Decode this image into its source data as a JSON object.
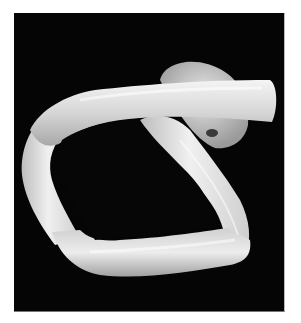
{
  "image": {
    "subject": "twisted-loop-object",
    "description": "Photograph of a pale, translucent twisted tube bent into a loop, on a black background",
    "colors": {
      "background": "#050505",
      "border": "#ffffff",
      "object_light": "#f2f2f2",
      "object_mid": "#cfcfcf",
      "object_shadow": "#8a8a8a"
    }
  }
}
